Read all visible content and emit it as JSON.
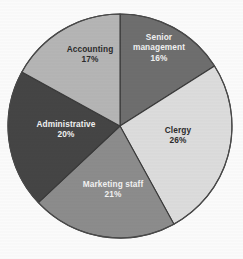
{
  "chart_data": {
    "type": "pie",
    "title": "",
    "subtitle": "",
    "xlabel": "",
    "ylabel": "",
    "legend_position": "none",
    "grid": false,
    "units": "percent",
    "total": 100,
    "start_angle_deg": 0,
    "direction": "clockwise",
    "categories": [
      "Senior management",
      "Clergy",
      "Marketing staff",
      "Administrative",
      "Accounting"
    ],
    "values": [
      16,
      26,
      21,
      20,
      17
    ],
    "slices": [
      {
        "label": "Senior management",
        "value": 16,
        "value_label": "16%",
        "color": "#6e6e6e",
        "text_color": "light",
        "label_line1": "Senior",
        "label_line2": "management",
        "label_x": 159,
        "label_y": 48
      },
      {
        "label": "Clergy",
        "value": 26,
        "value_label": "26%",
        "color": "#dcdcdc",
        "text_color": "dark",
        "label_line1": "Clergy",
        "label_line2": "",
        "label_x": 178,
        "label_y": 136
      },
      {
        "label": "Marketing staff",
        "value": 21,
        "value_label": "21%",
        "color": "#8c8c8c",
        "text_color": "light",
        "label_line1": "Marketing staff",
        "label_line2": "",
        "label_x": 113,
        "label_y": 190
      },
      {
        "label": "Administrative",
        "value": 20,
        "value_label": "20%",
        "color": "#454545",
        "text_color": "light",
        "label_line1": "Administrative",
        "label_line2": "",
        "label_x": 66,
        "label_y": 130
      },
      {
        "label": "Accounting",
        "value": 17,
        "value_label": "17%",
        "color": "#b5b5b5",
        "text_color": "dark",
        "label_line1": "Accounting",
        "label_line2": "",
        "label_x": 90,
        "label_y": 55
      }
    ],
    "geometry": {
      "center_x": 120,
      "center_y": 126,
      "radius": 112
    },
    "colors": {
      "background": "#fbfbfb",
      "outline": "#3a3a3a",
      "label_light": "#f2f2f2",
      "label_dark": "#2b2b2b"
    }
  }
}
